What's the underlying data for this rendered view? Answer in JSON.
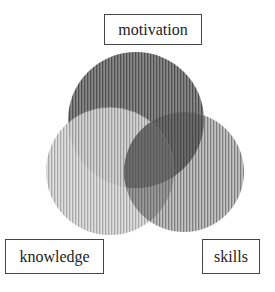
{
  "diagram": {
    "type": "venn",
    "sets": [
      {
        "id": "motivation",
        "label": "motivation",
        "color": "#6e6e6e"
      },
      {
        "id": "knowledge",
        "label": "knowledge",
        "color": "#b5b5b5"
      },
      {
        "id": "skills",
        "label": "skills",
        "color": "#8c8c8c"
      }
    ],
    "labels": {
      "top": "motivation",
      "bottom_left": "knowledge",
      "bottom_right": "skills"
    }
  }
}
